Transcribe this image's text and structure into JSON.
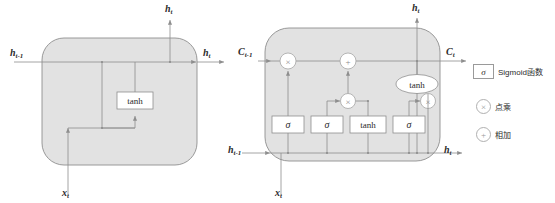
{
  "figure": {
    "type": "diagram",
    "background": "#ffffff",
    "cell_fill": "#e2e2e2",
    "stroke": "#8e8e8e",
    "box_fill": "#ffffff"
  },
  "rnn_cell": {
    "name": "simple-rnn-cell",
    "inputs": {
      "h_prev": "h",
      "h_prev_sub": "t-1",
      "x": "x",
      "x_sub": "t"
    },
    "outputs": {
      "h_right": "h",
      "h_right_sub": "t",
      "h_top": "h",
      "h_top_sub": "t"
    },
    "nodes": [
      {
        "id": "tanh",
        "label": "tanh",
        "shape": "rect"
      }
    ]
  },
  "lstm_cell": {
    "name": "lstm-cell",
    "inputs": {
      "c_prev": "C",
      "c_prev_sub": "t-1",
      "h_prev": "h",
      "h_prev_sub": "t-1",
      "x": "x",
      "x_sub": "t"
    },
    "outputs": {
      "c_next": "C",
      "c_next_sub": "t",
      "h_next": "h",
      "h_next_sub": "t",
      "h_top": "h",
      "h_top_sub": "t"
    },
    "gates": [
      {
        "id": "forget-gate",
        "label": "σ",
        "shape": "rect"
      },
      {
        "id": "input-gate",
        "label": "σ",
        "shape": "rect"
      },
      {
        "id": "candidate-gate",
        "label": "tanh",
        "shape": "rect"
      },
      {
        "id": "output-gate",
        "label": "σ",
        "shape": "rect"
      }
    ],
    "operators": [
      {
        "id": "forget-multiply",
        "label": "×",
        "shape": "circle"
      },
      {
        "id": "cell-add",
        "label": "+",
        "shape": "circle"
      },
      {
        "id": "input-multiply",
        "label": "×",
        "shape": "circle"
      },
      {
        "id": "output-multiply",
        "label": "×",
        "shape": "circle"
      },
      {
        "id": "cell-tanh",
        "label": "tanh",
        "shape": "ellipse"
      }
    ]
  },
  "legend": {
    "name": "legend-panel",
    "items": [
      {
        "symbol": "σ",
        "shape": "rect",
        "label": "Sigmoid函数"
      },
      {
        "symbol": "×",
        "shape": "circle",
        "label": "点乘"
      },
      {
        "symbol": "+",
        "shape": "circle",
        "label": "相加"
      }
    ]
  }
}
